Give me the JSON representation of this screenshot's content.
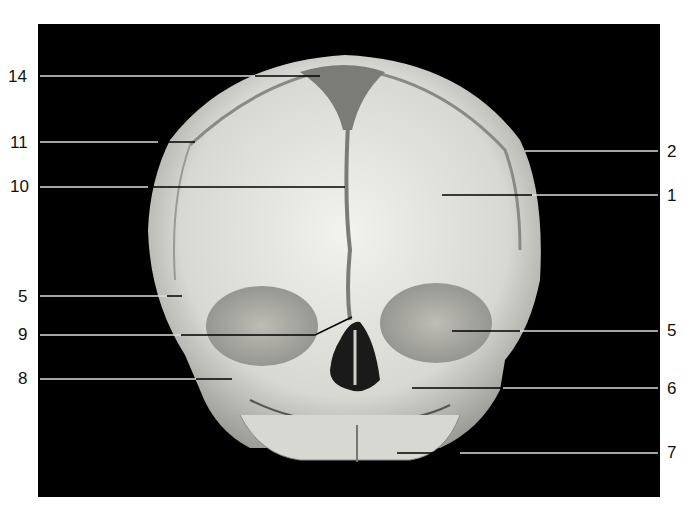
{
  "figure": {
    "background_color": "#000000",
    "bone_color": "#dcdcd6"
  },
  "labels": {
    "left": [
      {
        "id": "14",
        "text": "14",
        "y": 77
      },
      {
        "id": "11",
        "text": "11",
        "y": 143
      },
      {
        "id": "10",
        "text": "10",
        "y": 187
      },
      {
        "id": "5l",
        "text": "5",
        "y": 297
      },
      {
        "id": "9",
        "text": "9",
        "y": 335
      },
      {
        "id": "8",
        "text": "8",
        "y": 379
      }
    ],
    "right": [
      {
        "id": "2",
        "text": "2",
        "y": 152
      },
      {
        "id": "1",
        "text": "1",
        "y": 196
      },
      {
        "id": "5r",
        "text": "5",
        "y": 331
      },
      {
        "id": "6",
        "text": "6",
        "y": 389
      },
      {
        "id": "7",
        "text": "7",
        "y": 453
      }
    ]
  }
}
